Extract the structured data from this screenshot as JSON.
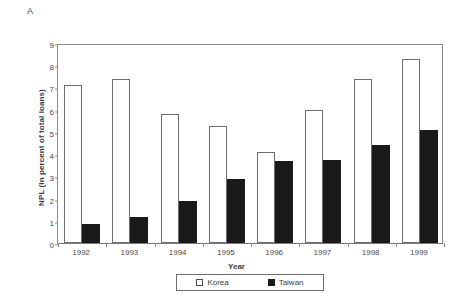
{
  "panel": {
    "label": "A"
  },
  "chart_data": {
    "type": "bar",
    "title": "",
    "subtitle": "",
    "xlabel": "Year",
    "ylabel": "NPL (in percent of total loans)",
    "categories": [
      "1992",
      "1993",
      "1994",
      "1995",
      "1996",
      "1997",
      "1998",
      "1999"
    ],
    "series": [
      {
        "name": "Korea",
        "values": [
          7.1,
          7.4,
          5.8,
          5.25,
          4.1,
          6.0,
          7.4,
          8.3
        ],
        "color": "#ffffff",
        "marker": "open-square"
      },
      {
        "name": "Taiwan",
        "values": [
          0.85,
          1.15,
          1.9,
          2.9,
          3.7,
          3.75,
          4.4,
          5.1
        ],
        "color": "#1a1a1a",
        "marker": "filled-square"
      }
    ],
    "ylim": [
      0,
      9
    ],
    "yticks": [
      "0",
      "1",
      "2",
      "3",
      "4",
      "5",
      "6",
      "7",
      "8",
      "9"
    ],
    "grid": false,
    "legend_position": "bottom",
    "legend_entries": [
      "Korea",
      "Taiwan"
    ]
  }
}
